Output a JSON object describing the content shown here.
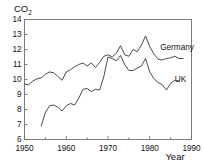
{
  "chart_data": {
    "type": "line",
    "title": "CO2",
    "title_main": "CO",
    "title_sub": "2",
    "xlabel": "Year",
    "ylabel": "CO2",
    "xlim": [
      1950,
      1990
    ],
    "ylim": [
      6,
      14
    ],
    "grid": false,
    "legend_position": "inline-right",
    "x_ticks_major": [
      1950,
      1960,
      1970,
      1980,
      1990
    ],
    "x_ticks_minor": [
      1955,
      1965,
      1975,
      1985
    ],
    "x_tick_labels": [
      "1950",
      "1960",
      "1970",
      "1980",
      "1990"
    ],
    "y_ticks": [
      6,
      7,
      8,
      9,
      10,
      11,
      12,
      13,
      14
    ],
    "y_tick_labels": [
      "6",
      "7",
      "8",
      "9",
      "10",
      "11",
      "12",
      "13",
      "14"
    ],
    "series": [
      {
        "name": "Germany",
        "label": "Germany",
        "color": "#2b2b2b",
        "label_x": 1982.5,
        "label_y": 11.95,
        "x": [
          1950,
          1951,
          1952,
          1953,
          1954,
          1955,
          1956,
          1957,
          1958,
          1959,
          1960,
          1961,
          1962,
          1963,
          1964,
          1965,
          1966,
          1967,
          1968,
          1969,
          1970,
          1971,
          1972,
          1973,
          1974,
          1975,
          1976,
          1977,
          1978,
          1979,
          1980,
          1981,
          1982,
          1983,
          1984,
          1985,
          1986,
          1987,
          1988
        ],
        "values": [
          9.7,
          9.65,
          9.9,
          10.05,
          10.1,
          10.35,
          10.5,
          10.45,
          10.2,
          9.95,
          10.5,
          10.65,
          10.85,
          11.0,
          11.1,
          10.9,
          11.1,
          10.8,
          11.15,
          11.55,
          11.65,
          11.5,
          11.75,
          12.25,
          11.65,
          11.55,
          12.0,
          11.85,
          12.3,
          12.9,
          12.2,
          11.7,
          11.35,
          11.3,
          11.4,
          11.45,
          11.55,
          11.4,
          11.4
        ]
      },
      {
        "name": "UK",
        "label": "UK",
        "color": "#2b2b2b",
        "label_x": 1986.0,
        "label_y": 9.85,
        "x": [
          1954,
          1955,
          1956,
          1957,
          1958,
          1959,
          1960,
          1961,
          1962,
          1963,
          1964,
          1965,
          1966,
          1967,
          1968,
          1969,
          1970,
          1971,
          1972,
          1973,
          1974,
          1975,
          1976,
          1977,
          1978,
          1979,
          1980,
          1981,
          1982,
          1983,
          1984,
          1985,
          1986,
          1987
        ],
        "values": [
          6.9,
          7.8,
          8.25,
          8.3,
          8.15,
          7.9,
          8.25,
          8.4,
          8.3,
          8.75,
          9.35,
          9.4,
          9.2,
          9.35,
          9.3,
          10.2,
          11.5,
          11.4,
          11.25,
          11.6,
          11.0,
          10.6,
          10.6,
          10.75,
          10.9,
          11.4,
          10.5,
          10.05,
          9.8,
          9.65,
          9.3,
          9.75,
          9.95,
          9.9
        ]
      }
    ]
  },
  "axes": {
    "y_axis_title": "CO2",
    "x_axis_title": "Year"
  }
}
